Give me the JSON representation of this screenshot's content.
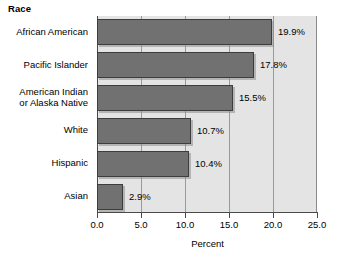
{
  "chart_data": {
    "type": "bar",
    "orientation": "horizontal",
    "title": "Race",
    "xlabel": "Percent",
    "ylabel": "",
    "xlim": [
      0.0,
      25.0
    ],
    "xticks": [
      "0.0",
      "5.0",
      "10.0",
      "15.0",
      "20.0",
      "25.0"
    ],
    "xtick_values": [
      0.0,
      5.0,
      10.0,
      15.0,
      20.0,
      25.0
    ],
    "grid": true,
    "grid_axis": "x",
    "legend": "none",
    "categories": [
      "African American",
      "Pacific Islander",
      "American Indian\nor Alaska Native",
      "White",
      "Hispanic",
      "Asian"
    ],
    "values": [
      19.9,
      17.8,
      15.5,
      10.7,
      10.4,
      2.9
    ],
    "data_labels": [
      "19.9%",
      "17.8%",
      "15.5%",
      "10.7%",
      "10.4%",
      "2.9%"
    ],
    "bar_color": "#717171",
    "bar_edge_color": "#3d3d3d",
    "plot_background": "#e4e4e4",
    "figure_background": "#ffffff"
  }
}
